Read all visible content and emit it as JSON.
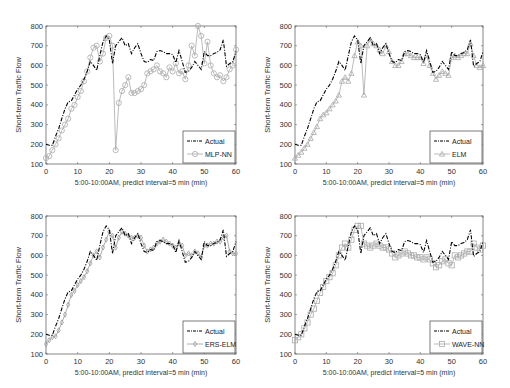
{
  "chart_data": [
    {
      "type": "line",
      "panel": "top-left",
      "title": "",
      "xlabel": "5:00-10:00AM, predict interval=5 min  (min)",
      "ylabel": "Short-term Traffic Flow",
      "xlim": [
        0,
        60
      ],
      "ylim": [
        100,
        800
      ],
      "xticks": [
        0,
        10,
        20,
        30,
        40,
        50,
        60
      ],
      "yticks": [
        100,
        200,
        300,
        400,
        500,
        600,
        700,
        800
      ],
      "grid": false,
      "legend_position": "lower right",
      "legend": [
        "Actual",
        "MLP-NN"
      ],
      "x": [
        0,
        1,
        2,
        3,
        4,
        5,
        6,
        7,
        8,
        9,
        10,
        11,
        12,
        13,
        14,
        15,
        16,
        17,
        18,
        19,
        20,
        21,
        22,
        23,
        24,
        25,
        26,
        27,
        28,
        29,
        30,
        31,
        32,
        33,
        34,
        35,
        36,
        37,
        38,
        39,
        40,
        41,
        42,
        43,
        44,
        45,
        46,
        47,
        48,
        49,
        50,
        51,
        52,
        53,
        54,
        55,
        56,
        57,
        58,
        59,
        60
      ],
      "series": [
        {
          "name": "Actual",
          "style": "dash-dot",
          "color": "#000000",
          "values": [
            200,
            195,
            195,
            240,
            280,
            330,
            380,
            415,
            420,
            450,
            480,
            500,
            530,
            570,
            620,
            600,
            575,
            650,
            720,
            750,
            730,
            610,
            700,
            720,
            740,
            700,
            710,
            660,
            690,
            710,
            660,
            620,
            615,
            630,
            625,
            670,
            675,
            670,
            660,
            660,
            655,
            615,
            675,
            620,
            565,
            570,
            590,
            620,
            600,
            580,
            670,
            650,
            650,
            660,
            665,
            680,
            730,
            595,
            610,
            620,
            670
          ]
        },
        {
          "name": "MLP-NN",
          "style": "solid-circle-marker",
          "color": "#aaaaaa",
          "values": [
            130,
            140,
            170,
            200,
            230,
            270,
            300,
            330,
            380,
            400,
            440,
            470,
            520,
            570,
            640,
            690,
            700,
            620,
            660,
            740,
            750,
            700,
            170,
            410,
            470,
            500,
            540,
            460,
            460,
            470,
            480,
            500,
            560,
            570,
            580,
            600,
            570,
            560,
            540,
            590,
            570,
            610,
            560,
            570,
            530,
            600,
            700,
            650,
            800,
            750,
            610,
            720,
            600,
            560,
            540,
            550,
            520,
            540,
            580,
            600,
            680
          ]
        }
      ]
    },
    {
      "type": "line",
      "panel": "top-right",
      "title": "",
      "xlabel": "5:00-10:00AM, predict interval=5 min  (min)",
      "ylabel": "Short-term Traffic Flow",
      "xlim": [
        0,
        60
      ],
      "ylim": [
        100,
        800
      ],
      "xticks": [
        0,
        10,
        20,
        30,
        40,
        50,
        60
      ],
      "yticks": [
        100,
        200,
        300,
        400,
        500,
        600,
        700,
        800
      ],
      "grid": false,
      "legend_position": "lower right",
      "legend": [
        "Actual",
        "ELM"
      ],
      "x": [
        0,
        1,
        2,
        3,
        4,
        5,
        6,
        7,
        8,
        9,
        10,
        11,
        12,
        13,
        14,
        15,
        16,
        17,
        18,
        19,
        20,
        21,
        22,
        23,
        24,
        25,
        26,
        27,
        28,
        29,
        30,
        31,
        32,
        33,
        34,
        35,
        36,
        37,
        38,
        39,
        40,
        41,
        42,
        43,
        44,
        45,
        46,
        47,
        48,
        49,
        50,
        51,
        52,
        53,
        54,
        55,
        56,
        57,
        58,
        59,
        60
      ],
      "series": [
        {
          "name": "Actual",
          "style": "dash-dot",
          "color": "#000000",
          "values": [
            200,
            195,
            195,
            240,
            280,
            330,
            380,
            415,
            420,
            450,
            480,
            500,
            530,
            570,
            620,
            600,
            575,
            650,
            720,
            750,
            730,
            610,
            700,
            720,
            740,
            700,
            710,
            660,
            690,
            710,
            660,
            620,
            615,
            630,
            625,
            670,
            675,
            670,
            660,
            660,
            655,
            615,
            675,
            620,
            565,
            570,
            590,
            620,
            600,
            580,
            670,
            650,
            650,
            660,
            665,
            680,
            730,
            595,
            610,
            620,
            670
          ]
        },
        {
          "name": "ELM",
          "style": "solid-triangle-marker",
          "color": "#aaaaaa",
          "values": [
            130,
            145,
            160,
            180,
            200,
            230,
            260,
            290,
            330,
            350,
            360,
            380,
            400,
            420,
            450,
            520,
            540,
            520,
            560,
            650,
            720,
            700,
            450,
            700,
            730,
            710,
            700,
            680,
            660,
            700,
            670,
            620,
            600,
            600,
            620,
            660,
            660,
            650,
            640,
            640,
            640,
            610,
            650,
            600,
            560,
            530,
            550,
            570,
            560,
            550,
            640,
            650,
            640,
            650,
            660,
            660,
            710,
            650,
            600,
            590,
            600
          ]
        }
      ]
    },
    {
      "type": "line",
      "panel": "bottom-left",
      "title": "",
      "xlabel": "5:00-10:00AM, predict interval=5 min  (min)",
      "ylabel": "Short-term Traffic Flow",
      "xlim": [
        0,
        60
      ],
      "ylim": [
        100,
        800
      ],
      "xticks": [
        0,
        10,
        20,
        30,
        40,
        50,
        60
      ],
      "yticks": [
        100,
        200,
        300,
        400,
        500,
        600,
        700,
        800
      ],
      "grid": false,
      "legend_position": "lower right",
      "legend": [
        "Actual",
        "ERS-ELM"
      ],
      "x": [
        0,
        1,
        2,
        3,
        4,
        5,
        6,
        7,
        8,
        9,
        10,
        11,
        12,
        13,
        14,
        15,
        16,
        17,
        18,
        19,
        20,
        21,
        22,
        23,
        24,
        25,
        26,
        27,
        28,
        29,
        30,
        31,
        32,
        33,
        34,
        35,
        36,
        37,
        38,
        39,
        40,
        41,
        42,
        43,
        44,
        45,
        46,
        47,
        48,
        49,
        50,
        51,
        52,
        53,
        54,
        55,
        56,
        57,
        58,
        59,
        60
      ],
      "series": [
        {
          "name": "Actual",
          "style": "dash-dot",
          "color": "#000000",
          "values": [
            200,
            195,
            195,
            240,
            280,
            330,
            380,
            415,
            420,
            450,
            480,
            500,
            530,
            570,
            620,
            600,
            575,
            650,
            720,
            750,
            730,
            610,
            700,
            720,
            740,
            700,
            710,
            660,
            690,
            710,
            660,
            620,
            615,
            630,
            625,
            670,
            675,
            670,
            660,
            660,
            655,
            615,
            675,
            620,
            565,
            570,
            590,
            620,
            600,
            580,
            670,
            650,
            650,
            660,
            665,
            680,
            730,
            595,
            610,
            620,
            670
          ]
        },
        {
          "name": "ERS-ELM",
          "style": "solid-diamond-marker",
          "color": "#999999",
          "values": [
            150,
            170,
            185,
            190,
            220,
            260,
            300,
            350,
            400,
            420,
            450,
            470,
            490,
            520,
            560,
            600,
            620,
            590,
            640,
            680,
            720,
            700,
            640,
            690,
            720,
            710,
            700,
            690,
            690,
            700,
            690,
            650,
            620,
            630,
            640,
            660,
            670,
            680,
            670,
            660,
            650,
            640,
            660,
            650,
            600,
            610,
            600,
            620,
            610,
            590,
            650,
            650,
            660,
            660,
            670,
            670,
            690,
            700,
            620,
            610,
            610
          ]
        }
      ]
    },
    {
      "type": "line",
      "panel": "bottom-right",
      "title": "",
      "xlabel": "5:00-10:00AM, predict interval=5 min  (min)",
      "ylabel": "Short-term Traffic Flow",
      "xlim": [
        0,
        60
      ],
      "ylim": [
        100,
        800
      ],
      "xticks": [
        0,
        10,
        20,
        30,
        40,
        50,
        60
      ],
      "yticks": [
        100,
        200,
        300,
        400,
        500,
        600,
        700,
        800
      ],
      "grid": false,
      "legend_position": "lower right",
      "legend": [
        "Actual",
        "WAVE-NN"
      ],
      "x": [
        0,
        1,
        2,
        3,
        4,
        5,
        6,
        7,
        8,
        9,
        10,
        11,
        12,
        13,
        14,
        15,
        16,
        17,
        18,
        19,
        20,
        21,
        22,
        23,
        24,
        25,
        26,
        27,
        28,
        29,
        30,
        31,
        32,
        33,
        34,
        35,
        36,
        37,
        38,
        39,
        40,
        41,
        42,
        43,
        44,
        45,
        46,
        47,
        48,
        49,
        50,
        51,
        52,
        53,
        54,
        55,
        56,
        57,
        58,
        59,
        60
      ],
      "series": [
        {
          "name": "Actual",
          "style": "dash-dot",
          "color": "#000000",
          "values": [
            200,
            195,
            195,
            240,
            280,
            330,
            380,
            415,
            420,
            450,
            480,
            500,
            530,
            570,
            620,
            600,
            575,
            650,
            720,
            750,
            730,
            610,
            700,
            720,
            740,
            700,
            710,
            660,
            690,
            710,
            660,
            620,
            615,
            630,
            625,
            670,
            675,
            670,
            660,
            660,
            655,
            615,
            675,
            620,
            565,
            570,
            590,
            620,
            600,
            580,
            670,
            650,
            650,
            660,
            665,
            680,
            730,
            595,
            610,
            620,
            670
          ]
        },
        {
          "name": "WAVE-NN",
          "style": "solid-square-marker",
          "color": "#aaaaaa",
          "values": [
            170,
            185,
            200,
            230,
            260,
            300,
            330,
            370,
            410,
            440,
            470,
            490,
            510,
            550,
            600,
            640,
            660,
            640,
            680,
            730,
            750,
            750,
            660,
            650,
            640,
            650,
            660,
            650,
            640,
            640,
            630,
            610,
            590,
            600,
            610,
            620,
            610,
            600,
            600,
            590,
            590,
            580,
            590,
            580,
            560,
            540,
            550,
            570,
            580,
            560,
            550,
            600,
            590,
            600,
            610,
            620,
            620,
            660,
            640,
            630,
            650
          ]
        }
      ]
    }
  ],
  "panels": [
    {
      "id": "top-left",
      "ylabel": "Short-term Traffic Flow",
      "xlabel": "5:00-10:00AM, predict interval=5 min  (min)",
      "legend_actual": "Actual",
      "legend_model": "MLP-NN"
    },
    {
      "id": "top-right",
      "ylabel": "Short-term Traffic Flow",
      "xlabel": "5:00-10:00AM, predict interval=5 min  (min)",
      "legend_actual": "Actual",
      "legend_model": "ELM"
    },
    {
      "id": "bottom-left",
      "ylabel": "Short-term Traffic Flow",
      "xlabel": "5:00-10:00AM, predict interval=5 min  (min)",
      "legend_actual": "Actual",
      "legend_model": "ERS-ELM"
    },
    {
      "id": "bottom-right",
      "ylabel": "Short-term Traffic Flow",
      "xlabel": "5:00-10:00AM, predict interval=5 min  (min)",
      "legend_actual": "Actual",
      "legend_model": "WAVE-NN"
    }
  ]
}
